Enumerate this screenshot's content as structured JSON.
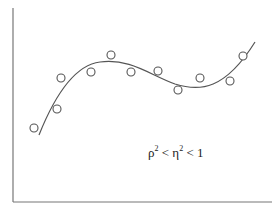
{
  "chart_data": {
    "type": "scatter",
    "title": "",
    "xlabel": "",
    "ylabel": "",
    "grid": false,
    "annotation": {
      "rho": "ρ",
      "eta": "η",
      "text": "ρ² < η² < 1",
      "lt1": "<",
      "lt2": "<",
      "one": "1",
      "sq": "2"
    },
    "points_px": [
      [
        34,
        128
      ],
      [
        57,
        109
      ],
      [
        61,
        78
      ],
      [
        91,
        72
      ],
      [
        111,
        55
      ],
      [
        131,
        72
      ],
      [
        158,
        71
      ],
      [
        178,
        90
      ],
      [
        200,
        78
      ],
      [
        230,
        81
      ],
      [
        243,
        56
      ]
    ],
    "fit_curve": "cubic",
    "colors": {
      "axis": "#777777",
      "curve": "#555555",
      "marker": "#555555"
    }
  }
}
